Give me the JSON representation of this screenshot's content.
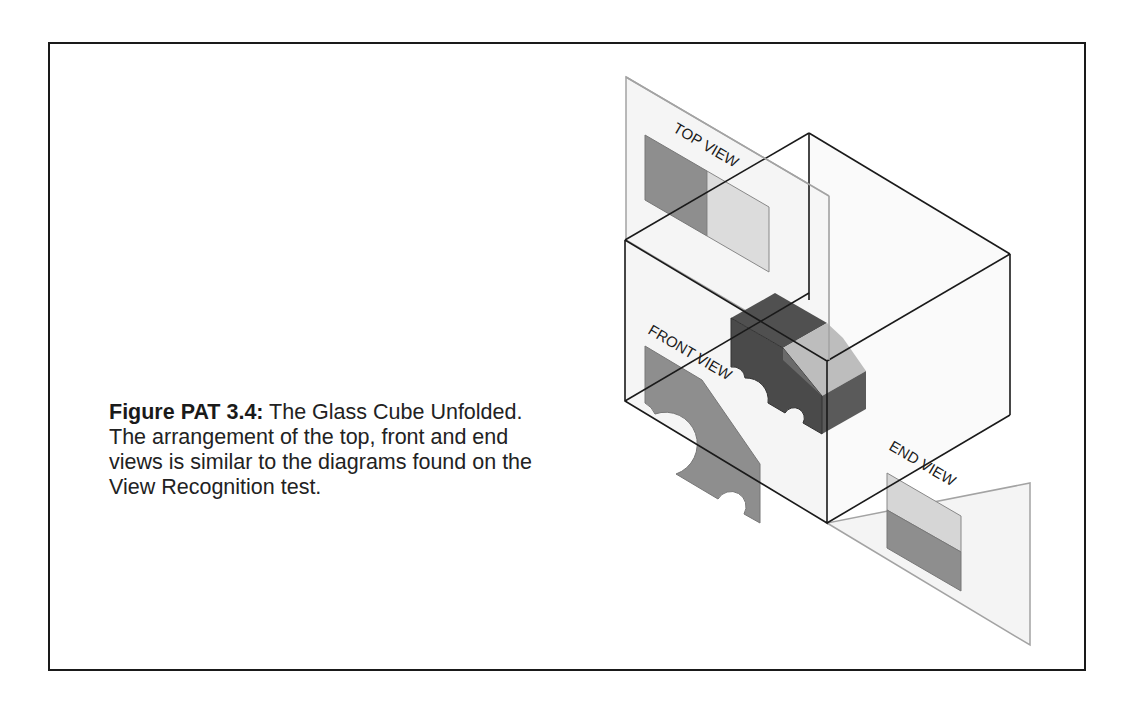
{
  "figure": {
    "label": "Figure PAT 3.4:",
    "caption": " The Glass Cube Unfolded. The arrangement of the top, front and end views is similar to the diagrams found on the View Recognition test."
  },
  "diagram": {
    "view_labels": {
      "top": "TOP VIEW",
      "front": "FRONT VIEW",
      "end": "END VIEW"
    },
    "colors": {
      "cube_edge": "#1a1a1a",
      "plane_edge": "#a0a0a0",
      "plane_fill": "#f4f4f4",
      "object_dark": "#4a4a4a",
      "object_mid": "#6e6e6e",
      "object_light": "#c8c8c8",
      "view_dark": "#8a8a8a",
      "view_light": "#d9d9d9"
    }
  }
}
